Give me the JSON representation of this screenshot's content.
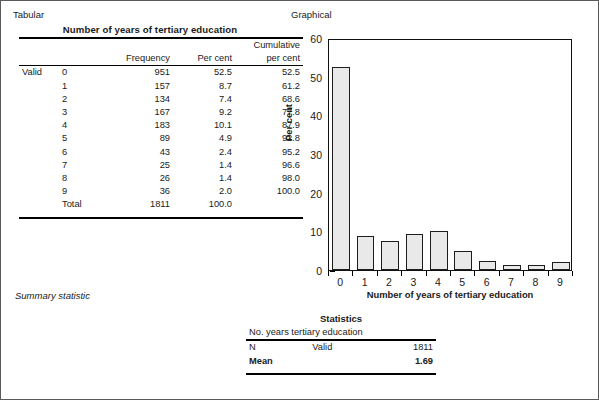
{
  "captions": {
    "tabular": "Tabular",
    "graphical": "Graphical",
    "summary": "Summary statistic"
  },
  "frequency_table": {
    "title": "Number of years of tertiary education",
    "headers": {
      "group": "",
      "category": "",
      "frequency": "Frequency",
      "percent": "Per cent",
      "cumulative_line1": "Cumulative",
      "cumulative_line2": "per cent"
    },
    "group_label": "Valid",
    "total_label": "Total",
    "rows": [
      {
        "category": "0",
        "frequency": "951",
        "percent": "52.5",
        "cumulative": "52.5"
      },
      {
        "category": "1",
        "frequency": "157",
        "percent": "8.7",
        "cumulative": "61.2"
      },
      {
        "category": "2",
        "frequency": "134",
        "percent": "7.4",
        "cumulative": "68.6"
      },
      {
        "category": "3",
        "frequency": "167",
        "percent": "9.2",
        "cumulative": "77.8"
      },
      {
        "category": "4",
        "frequency": "183",
        "percent": "10.1",
        "cumulative": "87.9"
      },
      {
        "category": "5",
        "frequency": "89",
        "percent": "4.9",
        "cumulative": "92.8"
      },
      {
        "category": "6",
        "frequency": "43",
        "percent": "2.4",
        "cumulative": "95.2"
      },
      {
        "category": "7",
        "frequency": "25",
        "percent": "1.4",
        "cumulative": "96.6"
      },
      {
        "category": "8",
        "frequency": "26",
        "percent": "1.4",
        "cumulative": "98.0"
      },
      {
        "category": "9",
        "frequency": "36",
        "percent": "2.0",
        "cumulative": "100.0"
      }
    ],
    "total": {
      "frequency": "1811",
      "percent": "100.0",
      "cumulative": ""
    }
  },
  "chart_data": {
    "type": "bar",
    "title": "",
    "xlabel": "Number of years of tertiary education",
    "ylabel": "Per cent",
    "categories": [
      "0",
      "1",
      "2",
      "3",
      "4",
      "5",
      "6",
      "7",
      "8",
      "9"
    ],
    "values": [
      52.5,
      8.7,
      7.4,
      9.2,
      10.1,
      4.9,
      2.4,
      1.4,
      1.4,
      2.0
    ],
    "ylim": [
      0,
      60
    ],
    "yticks": [
      0,
      10,
      20,
      30,
      40,
      50,
      60
    ],
    "ytick_labels": [
      "0",
      "10",
      "20",
      "30",
      "40",
      "50",
      "60"
    ],
    "grid": false,
    "legend": null,
    "bar_fill": "#e9e9e9",
    "bar_edge": "#1d1d1d"
  },
  "statistics_table": {
    "title": "Statistics",
    "variable": "No. years tertiary education",
    "rows": [
      {
        "label": "N",
        "sublabel": "Valid",
        "value": "1811",
        "bold": false
      },
      {
        "label": "Mean",
        "sublabel": "",
        "value": "1.69",
        "bold": true
      }
    ]
  }
}
